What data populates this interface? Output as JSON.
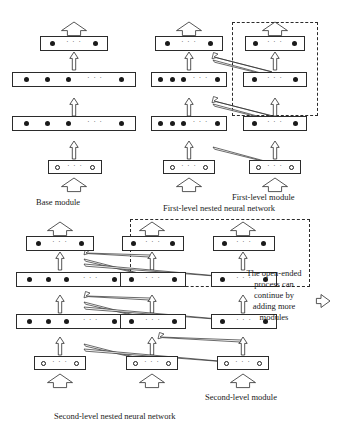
{
  "figure": {
    "background": "#ffffff",
    "ink": "#1a1a1a"
  },
  "glyphs": {
    "ellipsis": "· · ·",
    "filled_neuron": "filled-circle",
    "hollow_neuron": "hollow-circle",
    "up_arrow": "up-block-arrow",
    "wide_up_arrow": "wide-up-block-arrow",
    "diagonal_arrow": "diagonal-block-arrow",
    "right_arrow": "right-block-arrow"
  },
  "captions": {
    "base_module": "Base module",
    "first_level_module": "First-level module",
    "first_level_network": "First-level nested neural network",
    "second_level_module": "Second-level module",
    "second_level_network": "Second-level nested neural network"
  },
  "blurb": {
    "lines": [
      "The open-ended",
      "process can",
      "continue by",
      "adding more",
      "modules"
    ]
  },
  "modules": {
    "base": {
      "name": "Base module",
      "layers": [
        {
          "role": "output",
          "width": 68,
          "neurons": "2-filled",
          "dots": 2,
          "type": "filled"
        },
        {
          "role": "hidden-2",
          "width": 128,
          "neurons": "4-filled",
          "dots": 4,
          "type": "filled"
        },
        {
          "role": "hidden-1",
          "width": 128,
          "neurons": "4-filled",
          "dots": 4,
          "type": "filled"
        },
        {
          "role": "input",
          "width": 56,
          "neurons": "2-hollow",
          "dots": 2,
          "type": "hollow"
        }
      ]
    },
    "first_level": {
      "name": "First-level module",
      "column_count": 2,
      "new_module_column": 2
    },
    "second_level": {
      "name": "Second-level module",
      "column_count": 3,
      "new_module_columns": [
        2,
        3
      ]
    }
  }
}
